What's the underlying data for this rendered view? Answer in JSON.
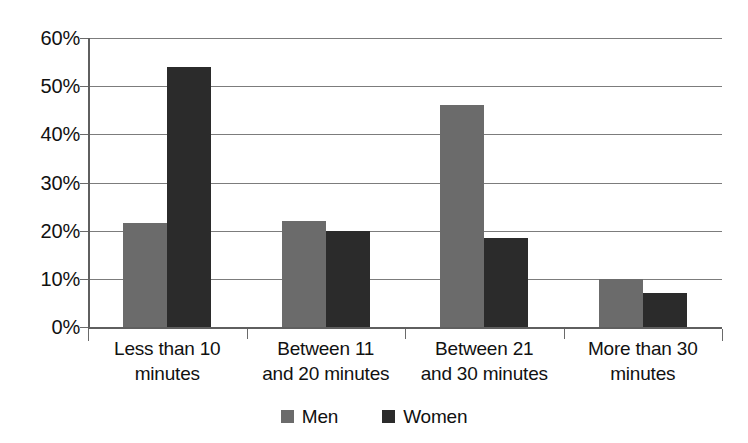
{
  "chart_data": {
    "type": "bar",
    "title": "",
    "subtitle": "",
    "xlabel": "",
    "ylabel": "",
    "ylim": [
      0,
      60
    ],
    "ytick_labels": [
      "60%",
      "50%",
      "40%",
      "30%",
      "20%",
      "10%",
      "0%"
    ],
    "ytick_values": [
      60,
      50,
      40,
      30,
      20,
      10,
      0
    ],
    "grid": true,
    "legend_position": "bottom",
    "categories": [
      "Less than 10 minutes",
      "Between 11 and 20 minutes",
      "Between 21 and 30 minutes",
      "More than 30 minutes"
    ],
    "category_lines": [
      [
        "Less than 10",
        "minutes"
      ],
      [
        "Between 11",
        "and 20 minutes"
      ],
      [
        "Between 21",
        "and 30 minutes"
      ],
      [
        "More than 30",
        "minutes"
      ]
    ],
    "series": [
      {
        "name": "Men",
        "color": "#6b6b6b",
        "values": [
          21.5,
          22.0,
          46.0,
          10.0
        ]
      },
      {
        "name": "Women",
        "color": "#2b2b2b",
        "values": [
          54.0,
          20.0,
          18.5,
          7.0
        ]
      }
    ]
  },
  "legend": {
    "items": [
      {
        "label": "Men",
        "color": "#6b6b6b"
      },
      {
        "label": "Women",
        "color": "#2b2b2b"
      }
    ]
  },
  "colors": {
    "men": "#6b6b6b",
    "women": "#2b2b2b",
    "gridline": "#7c7c7c",
    "axis": "#5f5f5f",
    "background": "#ffffff",
    "text": "#111111"
  }
}
